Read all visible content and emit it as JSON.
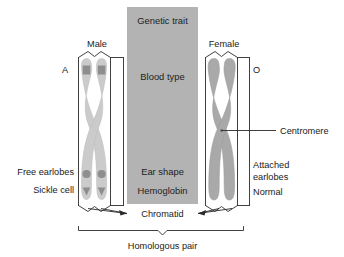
{
  "figure": {
    "background_color": "#ffffff",
    "panel_color": "#b3b3b3",
    "chromatid_male_color": "#cccccc",
    "chromatid_female_color": "#a8a8a8",
    "marker_color": "#8a8a8a",
    "line_color": "#2b2b2b"
  },
  "center_panel": {
    "name": "genetic-trait-panel",
    "rows": [
      {
        "label": "Genetic trait"
      },
      {
        "label": "Blood type"
      },
      {
        "label": "Ear shape"
      },
      {
        "label": "Hemoglobin"
      }
    ]
  },
  "male_chromosome": {
    "bracket_label": "Male",
    "allele_label": "A",
    "trait_labels": [
      {
        "label": "Free earlobes"
      },
      {
        "label": "Sickle cell"
      }
    ]
  },
  "female_chromosome": {
    "bracket_label": "Female",
    "allele_label": "O",
    "trait_labels": [
      {
        "label": "Attached"
      },
      {
        "label": "earlobes"
      },
      {
        "label": "Normal"
      }
    ]
  },
  "callouts": {
    "centromere": "Centromere",
    "chromatid": "Chromatid",
    "homologous_pair": "Homologous pair"
  }
}
